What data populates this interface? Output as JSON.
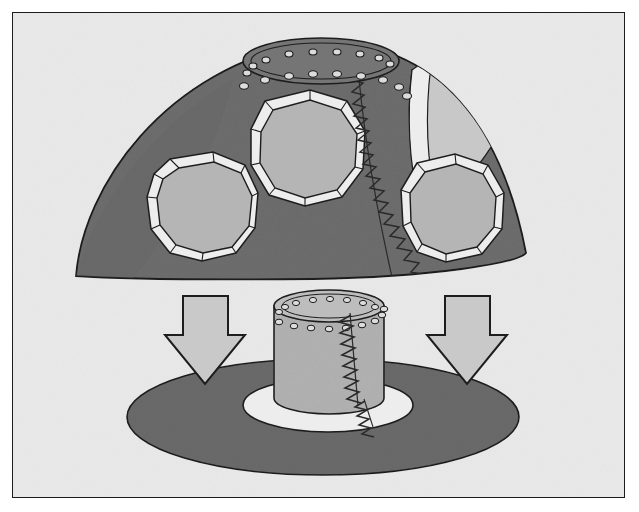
{
  "figure": {
    "kind": "technical-line-illustration",
    "caption": "",
    "frame": {
      "x": 12,
      "y": 12,
      "width": 613,
      "height": 486,
      "border_color": "#1d1d1d",
      "border_width": 1.5,
      "background_color": "#e9e9e9"
    },
    "palette": {
      "background": "#e9e9e9",
      "outline": "#1d1d1d",
      "dome_body": "#6d6d6d",
      "dome_body_shadow": "#5f5f5f",
      "window_glass": "#b5b5b5",
      "window_frame": "#e4e4e4",
      "ground_ellipse": "#6a6a6a",
      "cylinder_body": "#b2b2b2",
      "cylinder_top": "#bdbdbd",
      "collar_white": "#ededed",
      "arrow_fill": "#c9c9c9",
      "hole_fill": "#dcdcdc",
      "seam_stroke": "#2a2a2a"
    },
    "parts": [
      {
        "id": "dome",
        "name": "Dome bulkhead",
        "description": "Triangular-domed forward bulkhead shell with three circular cut-outs",
        "center_x": 322,
        "center_y": 150,
        "windows": 3,
        "seam": "zigzag weld seam running down the right-of-center meridian",
        "rivet_rows": 2
      },
      {
        "id": "top-collar",
        "name": "Top mounting collar",
        "description": "Elliptical mating flange at the apex of the dome with two rows of rivet holes",
        "holes_inner": 9,
        "holes_outer": 11
      },
      {
        "id": "window-left",
        "name": "Left circular port",
        "cx": 192,
        "cy": 190,
        "rx": 50,
        "ry": 52,
        "segments": 12
      },
      {
        "id": "window-center",
        "name": "Center circular port",
        "cx": 295,
        "cy": 134,
        "rx": 54,
        "ry": 57,
        "segments": 12
      },
      {
        "id": "window-right",
        "name": "Right circular port",
        "cx": 455,
        "cy": 192,
        "rx": 48,
        "ry": 51,
        "segments": 12
      },
      {
        "id": "window-cut",
        "name": "Partially cut-off upper-right port",
        "description": "Light panel clipped by the dome edge at the upper right"
      },
      {
        "id": "arrow-left",
        "name": "Left assembly direction arrow",
        "direction": "down",
        "x": 155,
        "y": 283,
        "width": 75,
        "height": 88
      },
      {
        "id": "arrow-right",
        "name": "Right assembly direction arrow",
        "direction": "down",
        "x": 420,
        "y": 283,
        "width": 75,
        "height": 88
      },
      {
        "id": "cylinder",
        "name": "Cylindrical barrel section",
        "description": "Short cylinder with riveted top flange and vertical zigzag weld seam",
        "cx": 322,
        "top_y": 292,
        "bottom_y": 400,
        "rx": 55,
        "ry": 16,
        "holes_inner": 8,
        "holes_outer": 9
      },
      {
        "id": "collar-base",
        "name": "White base collar",
        "description": "White elliptical ring at the foot of the cylinder",
        "cx": 322,
        "cy": 400,
        "rx": 85,
        "ry": 27
      },
      {
        "id": "ground-ellipse",
        "name": "Dark ground ellipse",
        "description": "Large dark ellipse representing the floor / assembly platform",
        "cx": 322,
        "cy": 404,
        "rx": 196,
        "ry": 58
      }
    ],
    "annotations": {
      "labels": [],
      "dimensions": [],
      "callouts": []
    }
  }
}
